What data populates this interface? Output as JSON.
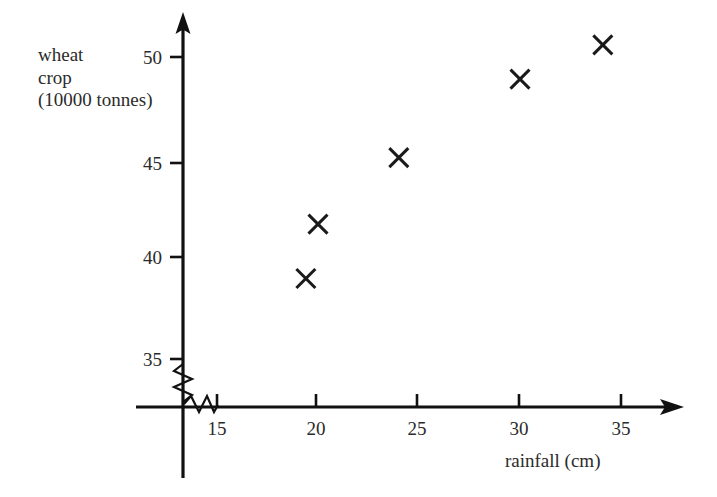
{
  "chart_data": {
    "type": "scatter",
    "title": "",
    "xlabel": "rainfall (cm)",
    "ylabel_lines": [
      "wheat",
      "crop",
      "(10000 tonnes)"
    ],
    "ylabel": "wheat crop (10000 tonnes)",
    "x": [
      19.4,
      20.0,
      24.0,
      30.0,
      34.1
    ],
    "y": [
      39.0,
      41.7,
      45.0,
      48.9,
      50.6
    ],
    "points": [
      {
        "x": 19.4,
        "y": 39.0
      },
      {
        "x": 20.0,
        "y": 41.7
      },
      {
        "x": 24.0,
        "y": 45.0
      },
      {
        "x": 30.0,
        "y": 48.9
      },
      {
        "x": 34.1,
        "y": 50.6
      }
    ],
    "xticks": [
      15,
      20,
      25,
      30,
      35
    ],
    "yticks": [
      35,
      40,
      45,
      50
    ],
    "xtick_labels": [
      "15",
      "20",
      "25",
      "30",
      "35"
    ],
    "ytick_labels": [
      "35",
      "40",
      "45",
      "50"
    ],
    "xlim": [
      13.9,
      35.9
    ],
    "ylim": [
      32.8,
      51.6
    ],
    "grid": false,
    "legend": null,
    "marker": "x",
    "marker_color": "#1a1a1a",
    "axis_color": "#111111",
    "background_color": "#ffffff",
    "axis_break_x": true,
    "axis_break_y": true,
    "annotations": []
  },
  "axes": {
    "y_axis_name": "wheat-crop-axis",
    "x_axis_name": "rainfall-axis",
    "break_symbol": "zigzag"
  }
}
